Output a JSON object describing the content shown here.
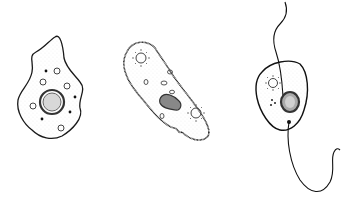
{
  "figure": {
    "background": "#ffffff",
    "stroke_color": "#1a1a1a",
    "organisms": [
      {
        "name": "amoeba",
        "icon": "amoeba-icon"
      },
      {
        "name": "paramecium",
        "icon": "paramecium-icon"
      },
      {
        "name": "flagellate",
        "icon": "flagellate-icon"
      }
    ]
  }
}
